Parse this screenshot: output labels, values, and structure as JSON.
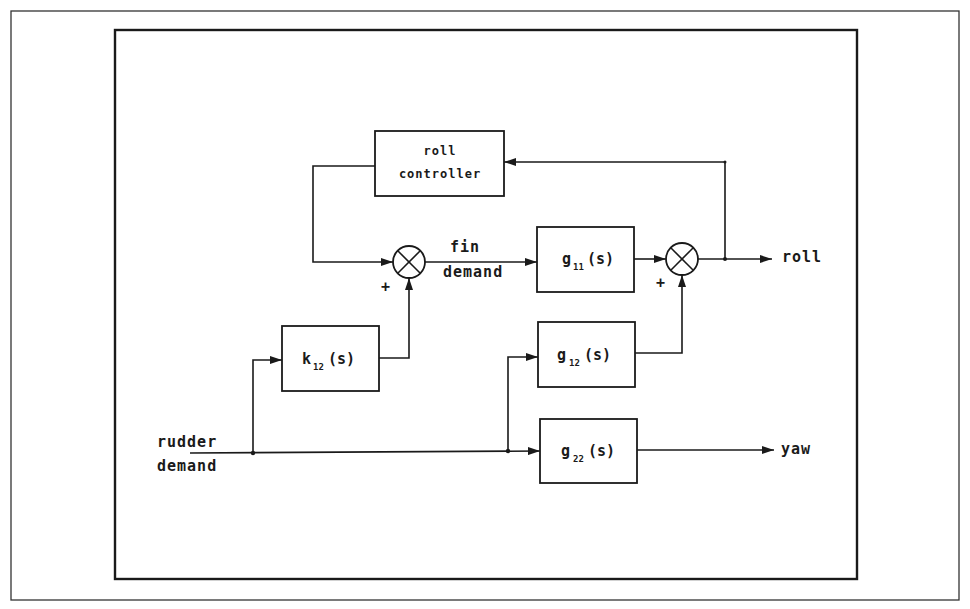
{
  "diagram": {
    "type": "block-diagram",
    "blocks": {
      "roll_controller": {
        "line1": "roll",
        "line2": "controller"
      },
      "g11": {
        "base": "g",
        "sub": "11",
        "arg": "(s)"
      },
      "g12": {
        "base": "g",
        "sub": "12",
        "arg": "(s)"
      },
      "g22": {
        "base": "g",
        "sub": "22",
        "arg": "(s)"
      },
      "k12": {
        "base": "k",
        "sub": "12",
        "arg": "(s)"
      }
    },
    "summing_junctions": [
      {
        "id": "sum1",
        "sign": "+"
      },
      {
        "id": "sum2",
        "sign": "+"
      }
    ],
    "signals": {
      "input_line1": "rudder",
      "input_line2": "demand",
      "fin_line1": "fin",
      "fin_line2": "demand",
      "output_roll": "roll",
      "output_yaw": "yaw"
    },
    "colors": {
      "ink": "#1a1a1a",
      "background": "#ffffff"
    }
  }
}
